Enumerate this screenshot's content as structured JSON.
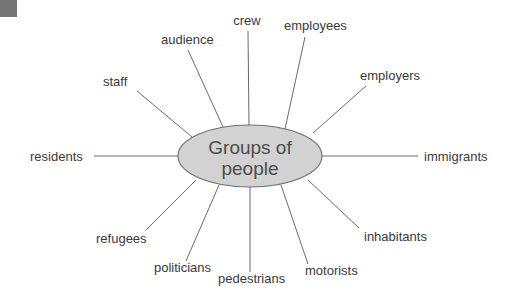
{
  "diagram": {
    "type": "spider-web-mind-map",
    "canvas": {
      "width": 510,
      "height": 305,
      "background": "#ffffff"
    },
    "corner_mark": {
      "name": "gray-corner-square",
      "color": "#757575"
    },
    "colors": {
      "hub_fill": "#d2d2d2",
      "hub_stroke": "#6e6e6e",
      "hub_text": "#4c4c4c",
      "label_text": "#3a3a3a",
      "spoke_line": "#6a6a6a"
    },
    "hub": {
      "label_line_1": "Groups of",
      "label_line_2": "people",
      "full_label": "Groups of people",
      "cx": 250,
      "cy": 156,
      "rx": 72,
      "ry": 31
    },
    "nodes": [
      {
        "id": "crew",
        "label": "crew",
        "tx": 247,
        "ty": 25,
        "anchor": "middle",
        "lx": 248,
        "ly": 31,
        "ex": 249,
        "ey": 125
      },
      {
        "id": "employees",
        "label": "employees",
        "tx": 284,
        "ty": 30,
        "anchor": "start",
        "lx": 305,
        "ly": 37,
        "ex": 285,
        "ey": 129
      },
      {
        "id": "audience",
        "label": "audience",
        "tx": 161,
        "ty": 44,
        "anchor": "start",
        "lx": 188,
        "ly": 50,
        "ex": 223,
        "ey": 127
      },
      {
        "id": "employers",
        "label": "employers",
        "tx": 360,
        "ty": 80,
        "anchor": "start",
        "lx": 366,
        "ly": 86,
        "ex": 313,
        "ey": 133
      },
      {
        "id": "staff",
        "label": "staff",
        "tx": 103,
        "ty": 86,
        "anchor": "start",
        "lx": 137,
        "ly": 91,
        "ex": 192,
        "ey": 137
      },
      {
        "id": "residents",
        "label": "residents",
        "tx": 30,
        "ty": 161,
        "anchor": "start",
        "lx": 94,
        "ly": 156,
        "ex": 178,
        "ey": 156
      },
      {
        "id": "immigrants",
        "label": "immigrants",
        "tx": 424,
        "ty": 161,
        "anchor": "start",
        "lx": 418,
        "ly": 156,
        "ex": 322,
        "ey": 156
      },
      {
        "id": "refugees",
        "label": "refugees",
        "tx": 96,
        "ty": 243,
        "anchor": "start",
        "lx": 146,
        "ly": 230,
        "ex": 196,
        "ey": 180
      },
      {
        "id": "inhabitants",
        "label": "inhabitants",
        "tx": 364,
        "ty": 241,
        "anchor": "start",
        "lx": 359,
        "ly": 228,
        "ex": 308,
        "ey": 180
      },
      {
        "id": "politicians",
        "label": "politicians",
        "tx": 154,
        "ty": 272,
        "anchor": "start",
        "lx": 186,
        "ly": 261,
        "ex": 219,
        "ey": 185
      },
      {
        "id": "pedestrians",
        "label": "pedestrians",
        "tx": 218,
        "ty": 283,
        "anchor": "start",
        "lx": 250,
        "ly": 272,
        "ex": 250,
        "ey": 187
      },
      {
        "id": "motorists",
        "label": "motorists",
        "tx": 305,
        "ty": 275,
        "anchor": "start",
        "lx": 308,
        "ly": 264,
        "ex": 281,
        "ey": 185
      }
    ]
  }
}
